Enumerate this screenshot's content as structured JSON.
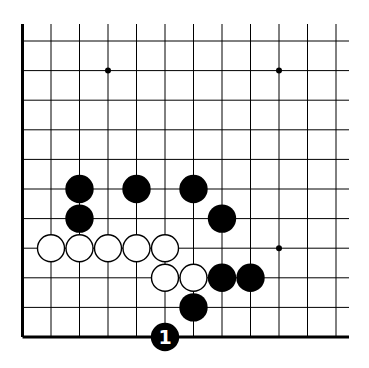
{
  "board": {
    "description": "Go problem diagram, bottom-left corner region",
    "colors": {
      "background": "#ffffff",
      "line": "#000000",
      "black_stone": "#000000",
      "white_stone": "#ffffff",
      "move_label": "#ffffff"
    },
    "grid": {
      "origin_x": 22.5,
      "origin_y": 41,
      "spacing_x": 28.5,
      "spacing_y": 29.6,
      "columns": 12,
      "rows": 11,
      "top_open_y": 24,
      "right_open_x": 349,
      "left_edge": true,
      "bottom_edge": true
    },
    "star_points": [
      {
        "col": 3,
        "row": 1
      },
      {
        "col": 9,
        "row": 1
      },
      {
        "col": 9,
        "row": 7
      }
    ],
    "stones": [
      {
        "color": "black",
        "col": 2,
        "row": 5
      },
      {
        "color": "black",
        "col": 4,
        "row": 5
      },
      {
        "color": "black",
        "col": 6,
        "row": 5
      },
      {
        "color": "black",
        "col": 2,
        "row": 6
      },
      {
        "color": "black",
        "col": 7,
        "row": 6
      },
      {
        "color": "white",
        "col": 1,
        "row": 7
      },
      {
        "color": "white",
        "col": 2,
        "row": 7
      },
      {
        "color": "white",
        "col": 3,
        "row": 7
      },
      {
        "color": "white",
        "col": 4,
        "row": 7
      },
      {
        "color": "white",
        "col": 5,
        "row": 7
      },
      {
        "color": "white",
        "col": 5,
        "row": 8
      },
      {
        "color": "white",
        "col": 6,
        "row": 8
      },
      {
        "color": "black",
        "col": 7,
        "row": 8
      },
      {
        "color": "black",
        "col": 8,
        "row": 8
      },
      {
        "color": "black",
        "col": 6,
        "row": 9
      },
      {
        "color": "black",
        "col": 5,
        "row": 10,
        "label": "1"
      }
    ]
  }
}
